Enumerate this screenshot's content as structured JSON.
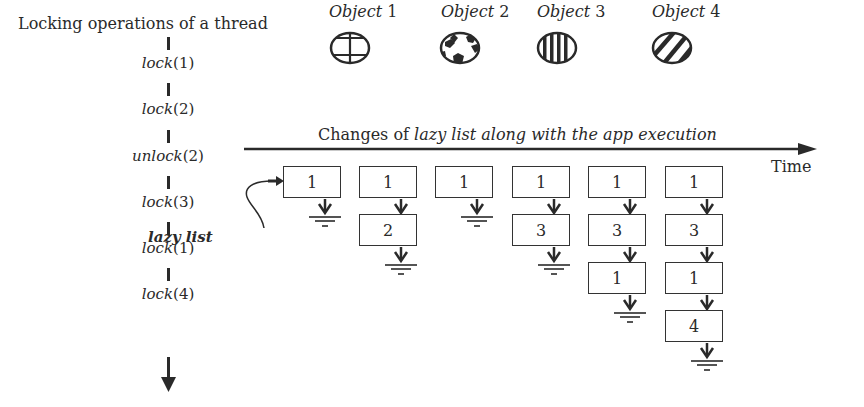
{
  "thread": {
    "title": "Locking operations of a thread",
    "operations": [
      {
        "fn": "lock",
        "arg": "(1)"
      },
      {
        "fn": "lock",
        "arg": "(2)"
      },
      {
        "fn": "unlock",
        "arg": "(2)"
      },
      {
        "fn": "lock",
        "arg": "(3)"
      },
      {
        "fn": "lock",
        "arg": "(1)"
      },
      {
        "fn": "lock",
        "arg": "(4)"
      }
    ]
  },
  "objects": [
    {
      "label": "Object",
      "num": "1",
      "pattern": "cross-grid"
    },
    {
      "label": "Object",
      "num": "2",
      "pattern": "dotted-blobs"
    },
    {
      "label": "Object",
      "num": "3",
      "pattern": "vertical-stripes"
    },
    {
      "label": "Object",
      "num": "4",
      "pattern": "diagonal-stripes"
    }
  ],
  "timeline": {
    "title_prefix": "Changes of ",
    "title_italic": "lazy list along with the app execution",
    "axis_label": "Time"
  },
  "lazy_list_label": "lazy list",
  "lazy_list_states": [
    [
      "1"
    ],
    [
      "1",
      "2"
    ],
    [
      "1"
    ],
    [
      "1",
      "3"
    ],
    [
      "1",
      "3",
      "1"
    ],
    [
      "1",
      "3",
      "1",
      "4"
    ]
  ],
  "colors": {
    "ink": "#2a2a2a",
    "background": "#ffffff"
  }
}
